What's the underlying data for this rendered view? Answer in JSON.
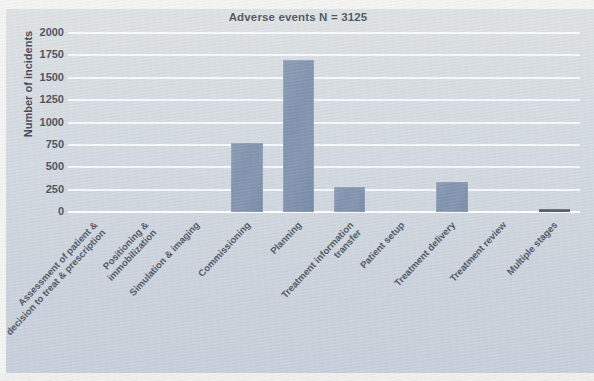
{
  "chart_data": {
    "type": "bar",
    "title": "Adverse events N = 3125",
    "xlabel": "",
    "ylabel": "Number of incidents",
    "ylim": [
      0,
      2000
    ],
    "ytick_labels": [
      "2000",
      "1750",
      "1500",
      "1250",
      "1000",
      "750",
      "500",
      "250",
      "0"
    ],
    "ytick_values": [
      2000,
      1750,
      1500,
      1250,
      1000,
      750,
      500,
      250,
      0
    ],
    "grid": true,
    "legend": "none",
    "categories": [
      "Assessment of patient & decision to treat & prescription",
      "Positioning & immobilization",
      "Simulation & imaging",
      "Commissioning",
      "Planning",
      "Treatment information transfer",
      "Patient setup",
      "Treatment delivery",
      "Treatment review",
      "Multiple stages"
    ],
    "category_lines": [
      [
        "Assessment of patient &",
        "decision to treat & prescription"
      ],
      [
        "Positioning &",
        "immobilization"
      ],
      [
        "Simulation & imaging",
        ""
      ],
      [
        "Commissioning",
        ""
      ],
      [
        "Planning",
        ""
      ],
      [
        "Treatment information",
        "transfer"
      ],
      [
        "Patient setup",
        ""
      ],
      [
        "Treatment delivery",
        ""
      ],
      [
        "Treatment review",
        ""
      ],
      [
        "Multiple stages",
        ""
      ]
    ],
    "values": [
      0,
      0,
      0,
      770,
      1700,
      280,
      0,
      330,
      0,
      20
    ],
    "bar_color": "#8193ae",
    "thin_bar_color": "#4a535d",
    "background_color": "#ccd5e0",
    "gridline_color": "#ffffff",
    "text_color": "#49525e"
  }
}
